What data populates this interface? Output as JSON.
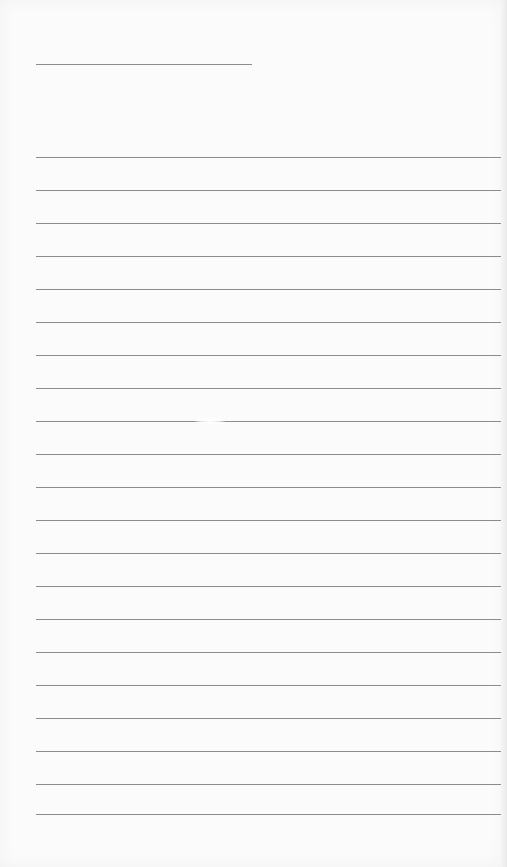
{
  "document": {
    "type": "lined-paper",
    "header_line": {
      "x": 36,
      "y": 64,
      "width": 216
    },
    "ruled_lines": {
      "count": 21,
      "x": 36,
      "width": 468,
      "y_positions": [
        157,
        190,
        223,
        256,
        289,
        322,
        355,
        388,
        421,
        454,
        487,
        520,
        553,
        586,
        619,
        652,
        685,
        718,
        751,
        784,
        814
      ]
    },
    "colors": {
      "paper": "#fbfbfb",
      "line": "#8c8c8c"
    }
  }
}
